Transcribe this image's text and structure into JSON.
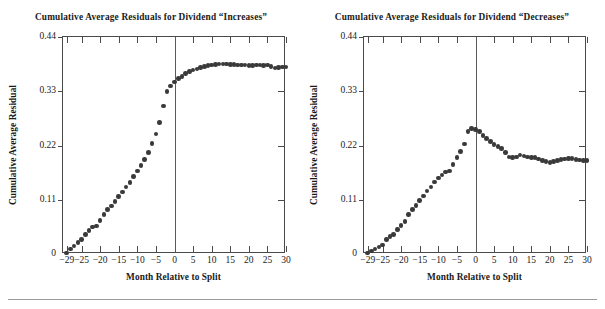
{
  "figure": {
    "panels": [
      {
        "id": "increases",
        "title": "Cumulative Average Residuals for Dividend “Increases”",
        "ylabel": "Cumulative Average Residual",
        "xlabel": "Month Relative to Split"
      },
      {
        "id": "decreases",
        "title": "Cumulative Average Residuals for Dividend “Decreases”",
        "ylabel": "Cumulative Average Residual",
        "xlabel": "Month Relative to Split"
      }
    ],
    "axis": {
      "ytick_labels": [
        "0.44",
        "0.33",
        "0.22",
        "0.11",
        "0"
      ],
      "ytick_values": [
        0.44,
        0.33,
        0.22,
        0.11,
        0
      ],
      "xtick_labels": [
        "−29",
        "−25",
        "−20",
        "−15",
        "−10",
        "−5",
        "0",
        "5",
        "10",
        "15",
        "20",
        "25",
        "30"
      ],
      "xtick_values": [
        -29,
        -25,
        -20,
        -15,
        -10,
        -5,
        0,
        5,
        10,
        15,
        20,
        25,
        30
      ],
      "xlim": [
        -30,
        30
      ],
      "ylim": [
        0,
        0.44
      ]
    },
    "colors": {
      "marker": "#3a3a3a",
      "axis": "#4a4a4a",
      "zero_line": "#5a5a5a",
      "background": "#ffffff",
      "rule": "#9a9a9a"
    }
  },
  "chart_data": [
    {
      "type": "scatter",
      "title": "Cumulative Average Residuals for Dividend “Increases”",
      "xlabel": "Month Relative to Split",
      "ylabel": "Cumulative Average Residual",
      "xlim": [
        -30,
        30
      ],
      "ylim": [
        0,
        0.44
      ],
      "grid": false,
      "legend": null,
      "annotations": [
        "vertical reference line at month 0"
      ],
      "x": [
        -29,
        -28,
        -27,
        -26,
        -25,
        -24,
        -23,
        -22,
        -21,
        -20,
        -19,
        -18,
        -17,
        -16,
        -15,
        -14,
        -13,
        -12,
        -11,
        -10,
        -9,
        -8,
        -7,
        -6,
        -5,
        -4,
        -3,
        -2,
        -1,
        0,
        1,
        2,
        3,
        4,
        5,
        6,
        7,
        8,
        9,
        10,
        11,
        12,
        13,
        14,
        15,
        16,
        17,
        18,
        19,
        20,
        21,
        22,
        23,
        24,
        25,
        26,
        27,
        28,
        29,
        30
      ],
      "y": [
        0.002,
        0.01,
        0.016,
        0.023,
        0.03,
        0.039,
        0.048,
        0.055,
        0.057,
        0.068,
        0.08,
        0.09,
        0.097,
        0.106,
        0.116,
        0.126,
        0.136,
        0.145,
        0.157,
        0.168,
        0.18,
        0.192,
        0.206,
        0.224,
        0.243,
        0.267,
        0.3,
        0.33,
        0.341,
        0.349,
        0.356,
        0.36,
        0.366,
        0.37,
        0.373,
        0.375,
        0.378,
        0.38,
        0.382,
        0.383,
        0.384,
        0.385,
        0.385,
        0.385,
        0.384,
        0.384,
        0.383,
        0.383,
        0.383,
        0.382,
        0.382,
        0.383,
        0.383,
        0.382,
        0.383,
        0.38,
        0.377,
        0.378,
        0.379,
        0.379
      ]
    },
    {
      "type": "scatter",
      "title": "Cumulative Average Residuals for Dividend “Decreases”",
      "xlabel": "Month Relative to Split",
      "ylabel": "Cumulative Average Residual",
      "xlim": [
        -30,
        30
      ],
      "ylim": [
        0,
        0.44
      ],
      "grid": false,
      "legend": null,
      "annotations": [
        "vertical reference line at month 0"
      ],
      "x": [
        -29,
        -28,
        -27,
        -26,
        -25,
        -24,
        -23,
        -22,
        -21,
        -20,
        -19,
        -18,
        -17,
        -16,
        -15,
        -14,
        -13,
        -12,
        -11,
        -10,
        -9,
        -8,
        -7,
        -6,
        -5,
        -4,
        -3,
        -2,
        -1,
        0,
        1,
        2,
        3,
        4,
        5,
        6,
        7,
        8,
        9,
        10,
        11,
        12,
        13,
        14,
        15,
        16,
        17,
        18,
        19,
        20,
        21,
        22,
        23,
        24,
        25,
        26,
        27,
        28,
        29,
        30
      ],
      "y": [
        0.002,
        0.006,
        0.01,
        0.014,
        0.018,
        0.03,
        0.035,
        0.04,
        0.05,
        0.058,
        0.066,
        0.08,
        0.09,
        0.098,
        0.108,
        0.118,
        0.128,
        0.136,
        0.146,
        0.154,
        0.16,
        0.166,
        0.168,
        0.182,
        0.196,
        0.208,
        0.223,
        0.248,
        0.255,
        0.253,
        0.248,
        0.24,
        0.234,
        0.228,
        0.222,
        0.218,
        0.214,
        0.206,
        0.197,
        0.196,
        0.197,
        0.201,
        0.199,
        0.197,
        0.196,
        0.196,
        0.193,
        0.19,
        0.187,
        0.186,
        0.188,
        0.19,
        0.192,
        0.193,
        0.194,
        0.194,
        0.192,
        0.191,
        0.19,
        0.19
      ]
    }
  ]
}
